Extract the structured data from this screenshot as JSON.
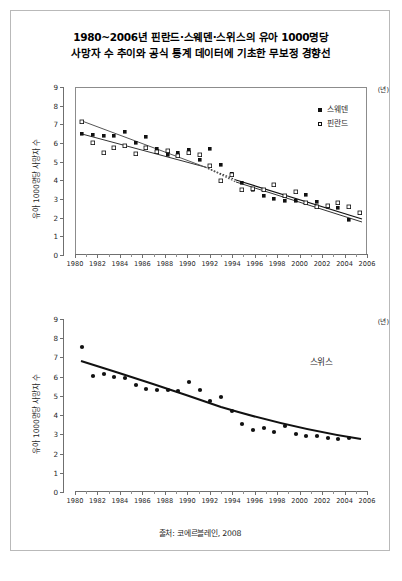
{
  "figure": {
    "title_line1": "1980~2006년 핀란드·스웨덴·스위스의 유아 1000명당",
    "title_line2": "사망자 수 추이와 공식 통계 데이터에 기초한 무보정 경향선",
    "source": "출처: 코에르블레인, 2008"
  },
  "chart_data": [
    {
      "id": "top",
      "type": "scatter",
      "title": "1980~2006년 핀란드·스웨덴의 유아 1000명당 사망자 수",
      "xlabel": "(년)",
      "ylabel": "유아 1000명당 사망자 수",
      "xlim": [
        1979,
        2007
      ],
      "ylim": [
        0,
        9
      ],
      "ytick_labels": [
        "0",
        "1",
        "2",
        "3",
        "4",
        "5",
        "6",
        "7",
        "8",
        "9"
      ],
      "xtick_labels": [
        "1980",
        "1982",
        "1984",
        "1986",
        "1988",
        "1990",
        "1992",
        "1994",
        "1996",
        "1998",
        "2000",
        "2002",
        "2004",
        "2006"
      ],
      "grid": false,
      "legend_position": "top-right",
      "legend": [
        {
          "label": "스웨덴",
          "marker": "filled-square"
        },
        {
          "label": "핀란드",
          "marker": "open-square"
        }
      ],
      "series": [
        {
          "name": "스웨덴",
          "marker": "filled-square",
          "x": [
            1980,
            1981,
            1982,
            1983,
            1984,
            1985,
            1986,
            1987,
            1988,
            1989,
            1990,
            1991,
            1992,
            1993,
            1994,
            1995,
            1996,
            1997,
            1998,
            1999,
            2000,
            2001,
            2002,
            2003,
            2004,
            2005,
            2006
          ],
          "values": [
            6.95,
            6.9,
            6.85,
            6.85,
            7.05,
            6.45,
            6.8,
            6.15,
            5.85,
            5.95,
            6.1,
            5.6,
            6.15,
            5.3,
            4.85,
            4.35,
            4.0,
            3.65,
            3.5,
            3.4,
            3.4,
            3.75,
            3.35,
            3.1,
            3.05,
            2.4,
            2.8
          ]
        },
        {
          "name": "핀란드",
          "marker": "open-square",
          "x": [
            1980,
            1981,
            1982,
            1983,
            1984,
            1985,
            1986,
            1987,
            1988,
            1989,
            1990,
            1991,
            1992,
            1993,
            1994,
            1995,
            1996,
            1997,
            1998,
            1999,
            2000,
            2001,
            2002,
            2003,
            2004,
            2005,
            2006
          ],
          "values": [
            7.6,
            6.5,
            5.95,
            6.2,
            6.3,
            5.9,
            6.2,
            6.0,
            6.05,
            5.75,
            5.9,
            5.8,
            5.2,
            4.4,
            4.7,
            3.9,
            4.0,
            3.9,
            4.2,
            3.6,
            3.8,
            3.2,
            3.0,
            3.1,
            3.3,
            3.0,
            2.8
          ]
        }
      ],
      "trendlines": [
        {
          "name": "스웨덴 무보정 경향선",
          "style": "solid-then-dotted-then-solid"
        },
        {
          "name": "핀란드 무보정 경향선",
          "style": "solid-then-dotted-then-solid"
        }
      ]
    },
    {
      "id": "bottom",
      "type": "scatter",
      "title": "1980~2006년 스위스의 유아 1000명당 사망자 수",
      "xlabel": "(년)",
      "ylabel": "유아 1000명당 사망자 수",
      "series_label": "스위스",
      "xlim": [
        1979,
        2007
      ],
      "ylim": [
        0,
        9
      ],
      "ytick_labels": [
        "0",
        "1",
        "2",
        "3",
        "4",
        "5",
        "6",
        "7",
        "8",
        "9"
      ],
      "xtick_labels": [
        "1980",
        "1982",
        "1984",
        "1986",
        "1988",
        "1990",
        "1992",
        "1994",
        "1996",
        "1998",
        "2000",
        "2002",
        "2004",
        "2006"
      ],
      "grid": false,
      "series": [
        {
          "name": "스위스",
          "marker": "filled-circle",
          "x": [
            1980,
            1981,
            1982,
            1983,
            1984,
            1985,
            1986,
            1987,
            1988,
            1989,
            1990,
            1991,
            1992,
            1993,
            1994,
            1995,
            1996,
            1997,
            1998,
            1999,
            2000,
            2001,
            2002,
            2003,
            2004,
            2005
          ],
          "values": [
            9.1,
            7.6,
            7.7,
            7.55,
            7.5,
            7.1,
            6.9,
            6.85,
            6.85,
            6.8,
            7.3,
            6.85,
            6.25,
            6.45,
            5.7,
            5.0,
            4.7,
            4.8,
            4.6,
            4.9,
            4.5,
            4.4,
            4.4,
            4.3,
            4.25,
            4.3
          ]
        }
      ],
      "trendlines": [
        {
          "name": "스위스 무보정 경향선",
          "style": "solid-curve"
        }
      ]
    }
  ]
}
